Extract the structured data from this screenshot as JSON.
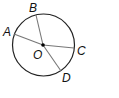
{
  "diagram": {
    "type": "circle-with-radii",
    "center": {
      "label": "O",
      "x": 43,
      "y": 45
    },
    "radius": 31,
    "points": [
      {
        "label": "A",
        "x": 14,
        "y": 34,
        "label_x": 3,
        "label_y": 36
      },
      {
        "label": "B",
        "x": 36,
        "y": 15,
        "label_x": 29,
        "label_y": 12
      },
      {
        "label": "C",
        "x": 74,
        "y": 48,
        "label_x": 77,
        "label_y": 55
      },
      {
        "label": "D",
        "x": 61,
        "y": 71,
        "label_x": 62,
        "label_y": 82
      }
    ],
    "colors": {
      "circle": "#222222",
      "radii": "#777777",
      "center_dot": "#000000"
    }
  }
}
